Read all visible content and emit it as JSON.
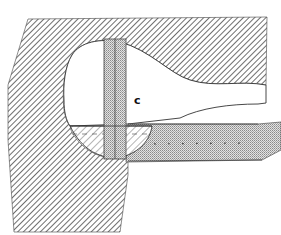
{
  "figure": {
    "type": "technical-section-drawing",
    "labels": [
      {
        "id": "c",
        "text": "c"
      }
    ],
    "colors": {
      "hatch": "#555555",
      "outline": "#333333",
      "stipple": "#9a9a9a",
      "background": "#ffffff"
    }
  }
}
